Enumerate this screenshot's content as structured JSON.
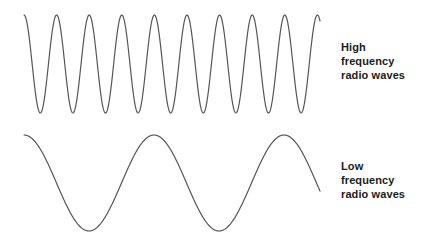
{
  "figure": {
    "background_color": "#ffffff",
    "stroke_color": "#555555",
    "text_color": "#1b1b1b",
    "width": 422,
    "height": 244
  },
  "labels": {
    "high": {
      "line1": "High",
      "line2": "frequency",
      "line3": "radio waves"
    },
    "low": {
      "line1": "Low",
      "line2": "frequency",
      "line3": "radio waves"
    }
  },
  "chart_data": {
    "type": "line",
    "title": "",
    "xlabel": "",
    "ylabel": "",
    "grid": false,
    "legend": "right",
    "axis_visible": false,
    "series": [
      {
        "name": "High frequency radio waves",
        "waveform": "sine",
        "x_start": 24,
        "x_end": 320,
        "center_y": 64,
        "amplitude": 49,
        "period_px": 32.6,
        "cycles": 9.1,
        "phase": "peak-at-start",
        "stroke": "#555555",
        "stroke_width": 1.2
      },
      {
        "name": "Low frequency radio waves",
        "waveform": "sine",
        "x_start": 24,
        "x_end": 320,
        "center_y": 183,
        "amplitude": 48,
        "period_px": 130,
        "cycles": 2.28,
        "phase": "peak-at-start",
        "stroke": "#555555",
        "stroke_width": 1.2
      }
    ]
  }
}
